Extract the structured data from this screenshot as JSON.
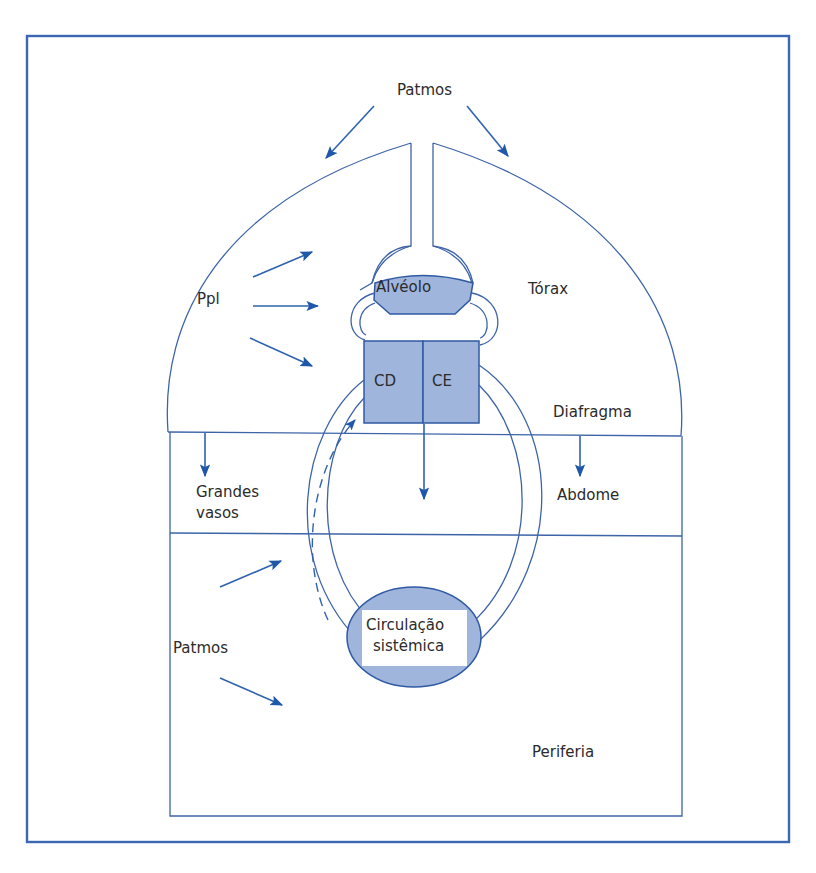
{
  "diagram": {
    "labels": {
      "patmos_top": "Patmos",
      "ppl": "Ppl",
      "alveolo": "Alvéolo",
      "torax": "Tórax",
      "cd": "CD",
      "ce": "CE",
      "diafragma": "Diafragma",
      "grandes": "Grandes",
      "vasos": "vasos",
      "abdome": "Abdome",
      "patmos_left": "Patmos",
      "circulacao": "Circulação",
      "sistemica": "sistêmica",
      "periferia": "Periferia"
    },
    "colors": {
      "line": "#3d64a8",
      "frame": "#3a66b3",
      "fill": "#9fb5dc",
      "arrow": "#1f58a8"
    }
  }
}
